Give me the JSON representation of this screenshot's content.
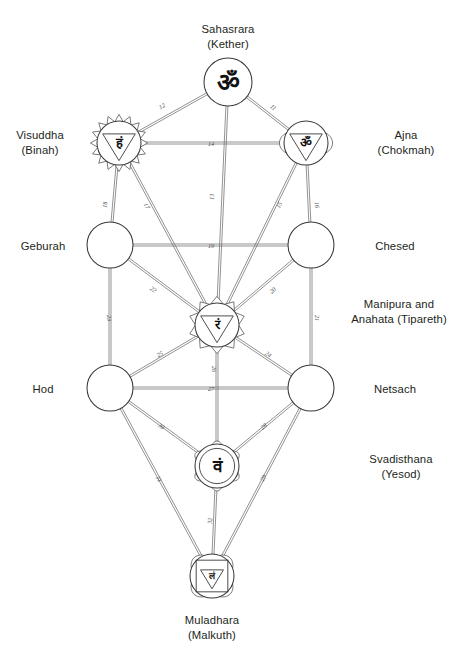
{
  "diagram": {
    "type": "node-link-diagram"
  },
  "nodes": [
    {
      "id": "sahasrara",
      "label": "Sahasrara\n(Kether)",
      "label_position": "top",
      "glyph": "ॐ",
      "glyph_name": "om-symbol",
      "shape": "circle",
      "cx": 228,
      "cy": 82,
      "r": 24
    },
    {
      "id": "visuddha",
      "label": "Visuddha\n(Binah)",
      "label_position": "left",
      "glyph": "हं",
      "glyph_name": "ham-bija-syllable",
      "shape": "lotus-16-petal",
      "cx": 119,
      "cy": 143,
      "r": 22
    },
    {
      "id": "ajna",
      "label": "Ajna\n(Chokmah)",
      "label_position": "right",
      "glyph": "ॐ",
      "glyph_name": "om-bija-syllable",
      "shape": "lotus-2-petal",
      "cx": 306,
      "cy": 143,
      "r": 22
    },
    {
      "id": "geburah",
      "label": "Geburah",
      "label_position": "left",
      "glyph": "",
      "glyph_name": "empty-sphere",
      "shape": "circle",
      "cx": 110,
      "cy": 245,
      "r": 23
    },
    {
      "id": "chesed",
      "label": "Chesed",
      "label_position": "right",
      "glyph": "",
      "glyph_name": "empty-sphere",
      "shape": "circle",
      "cx": 311,
      "cy": 245,
      "r": 23
    },
    {
      "id": "tipareth",
      "label": "Manipura and\nAnahata (Tipareth)",
      "label_position": "right",
      "glyph": "रं",
      "glyph_name": "ram-bija-syllable",
      "shape": "lotus-10-petal",
      "cx": 217,
      "cy": 325,
      "r": 22
    },
    {
      "id": "hod",
      "label": "Hod",
      "label_position": "left",
      "glyph": "",
      "glyph_name": "empty-sphere",
      "shape": "circle",
      "cx": 110,
      "cy": 388,
      "r": 23
    },
    {
      "id": "netsach",
      "label": "Netsach",
      "label_position": "right",
      "glyph": "",
      "glyph_name": "empty-sphere",
      "shape": "circle",
      "cx": 311,
      "cy": 388,
      "r": 23
    },
    {
      "id": "yesod",
      "label": "Svadisthana\n(Yesod)",
      "label_position": "right",
      "glyph": "वं",
      "glyph_name": "vam-bija-syllable",
      "shape": "lotus-6-petal",
      "cx": 217,
      "cy": 466,
      "r": 22
    },
    {
      "id": "malkuth",
      "label": "Muladhara\n(Malkuth)",
      "label_position": "bottom",
      "glyph": "लं",
      "glyph_name": "lam-bija-syllable",
      "shape": "lotus-4-petal",
      "cx": 212,
      "cy": 576,
      "r": 22
    }
  ],
  "paths": [
    {
      "number": "11",
      "from": "sahasrara",
      "to": "ajna",
      "label_x": 272,
      "label_y": 109
    },
    {
      "number": "12",
      "from": "sahasrara",
      "to": "visuddha",
      "label_x": 163,
      "label_y": 108
    },
    {
      "number": "13",
      "from": "sahasrara",
      "to": "tipareth",
      "label_x": 214,
      "label_y": 197
    },
    {
      "number": "14",
      "from": "visuddha",
      "to": "ajna",
      "label_x": 211,
      "label_y": 146
    },
    {
      "number": "15",
      "from": "ajna",
      "to": "tipareth",
      "label_x": 281,
      "label_y": 206
    },
    {
      "number": "16",
      "from": "ajna",
      "to": "chesed",
      "label_x": 315,
      "label_y": 205
    },
    {
      "number": "17",
      "from": "visuddha",
      "to": "tipareth",
      "label_x": 145,
      "label_y": 207
    },
    {
      "number": "18",
      "from": "visuddha",
      "to": "geburah",
      "label_x": 107,
      "label_y": 205
    },
    {
      "number": "19",
      "from": "geburah",
      "to": "chesed",
      "label_x": 211,
      "label_y": 248
    },
    {
      "number": "20",
      "from": "chesed",
      "to": "tipareth",
      "label_x": 274,
      "label_y": 292
    },
    {
      "number": "21",
      "from": "chesed",
      "to": "netsach",
      "label_x": 315,
      "label_y": 318
    },
    {
      "number": "22",
      "from": "geburah",
      "to": "tipareth",
      "label_x": 152,
      "label_y": 291
    },
    {
      "number": "23",
      "from": "geburah",
      "to": "hod",
      "label_x": 107,
      "label_y": 318
    },
    {
      "number": "24",
      "from": "tipareth",
      "to": "netsach",
      "label_x": 267,
      "label_y": 356
    },
    {
      "number": "25",
      "from": "tipareth",
      "to": "hod",
      "label_x": 161,
      "label_y": 356
    },
    {
      "number": "26",
      "from": "tipareth",
      "to": "yesod",
      "label_x": 212,
      "label_y": 369
    },
    {
      "number": "27",
      "from": "hod",
      "to": "netsach",
      "label_x": 211,
      "label_y": 391
    },
    {
      "number": "28",
      "from": "netsach",
      "to": "yesod",
      "label_x": 265,
      "label_y": 428
    },
    {
      "number": "29",
      "from": "netsach",
      "to": "malkuth",
      "label_x": 265,
      "label_y": 479
    },
    {
      "number": "30",
      "from": "hod",
      "to": "yesod",
      "label_x": 160,
      "label_y": 428
    },
    {
      "number": "31",
      "from": "hod",
      "to": "malkuth",
      "label_x": 157,
      "label_y": 480
    },
    {
      "number": "32",
      "from": "yesod",
      "to": "malkuth",
      "label_x": 212,
      "label_y": 521
    }
  ],
  "colors": {
    "background": "#ffffff",
    "stroke": "#3a3a3a",
    "edge": "#6e6e6e",
    "text": "#231f20",
    "path_number": "#4b4b4b"
  }
}
